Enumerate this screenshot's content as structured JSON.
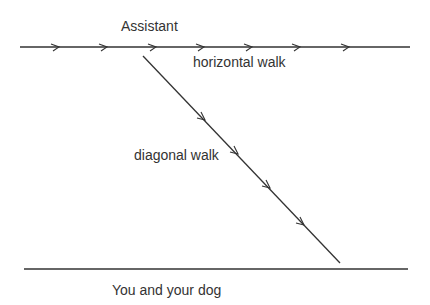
{
  "labels": {
    "top": "Assistant",
    "horizontal": "horizontal walk",
    "diagonal": "diagonal walk",
    "bottom": "You and your dog"
  },
  "colors": {
    "line": "#333333",
    "text": "#333333"
  }
}
